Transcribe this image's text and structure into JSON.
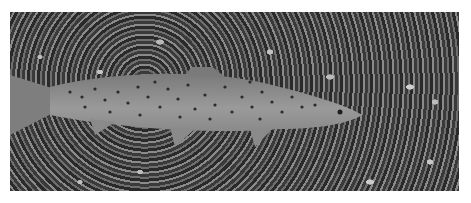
{
  "image": {
    "description": "Black-and-white underwater photograph of a spotted brown trout swimming right over a pebbly riverbed",
    "subject": "brown trout",
    "background": "pebbles and gravel riverbed",
    "colors": {
      "border": "#ffffff",
      "fish_body": "#8c8c8c",
      "spots": "#2b2b2b",
      "riverbed_dark": "#2a2a2a",
      "riverbed_light": "#c8c8c8"
    }
  }
}
